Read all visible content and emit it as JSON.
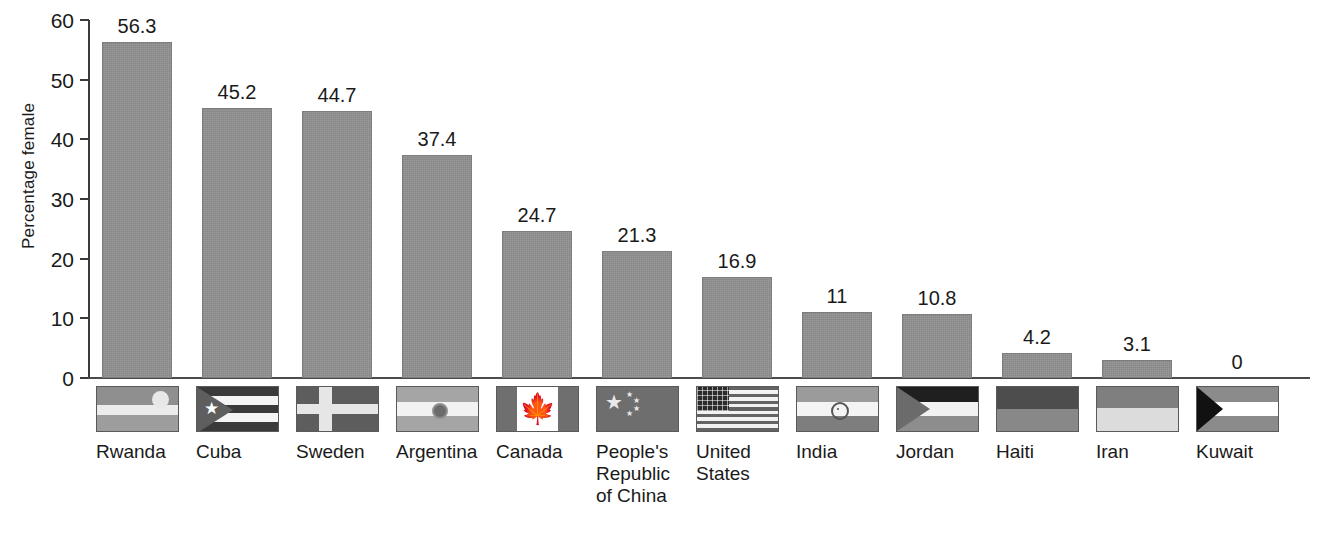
{
  "chart_data": {
    "type": "bar",
    "title": "",
    "subtitle": "",
    "xlabel": "",
    "ylabel": "Percentage female",
    "ylim": [
      0,
      60
    ],
    "yticks": [
      0,
      10,
      20,
      30,
      40,
      50,
      60
    ],
    "ytick_labels": [
      "0",
      "10",
      "20",
      "30",
      "40",
      "50",
      "60"
    ],
    "grid": false,
    "legend": null,
    "categories": [
      "Rwanda",
      "Cuba",
      "Sweden",
      "Argentina",
      "Canada",
      "People's\nRepublic\nof China",
      "United\nStates",
      "India",
      "Jordan",
      "Haiti",
      "Iran",
      "Kuwait"
    ],
    "values": [
      56.3,
      45.2,
      44.7,
      37.4,
      24.7,
      21.3,
      16.9,
      11,
      10.8,
      4.2,
      3.1,
      0
    ],
    "value_labels": [
      "56.3",
      "45.2",
      "44.7",
      "37.4",
      "24.7",
      "21.3",
      "16.9",
      "11",
      "10.8",
      "4.2",
      "3.1",
      "0"
    ],
    "bar_color": "#8e8e8e",
    "axis_color": "#3b3b3b"
  },
  "axis": {
    "y_title": "Percentage female",
    "ticks": [
      {
        "label": "60",
        "value": 60
      },
      {
        "label": "50",
        "value": 50
      },
      {
        "label": "40",
        "value": 40
      },
      {
        "label": "30",
        "value": 30
      },
      {
        "label": "20",
        "value": 20
      },
      {
        "label": "10",
        "value": 10
      },
      {
        "label": "0",
        "value": 0
      }
    ]
  },
  "bars": [
    {
      "country": "Rwanda",
      "value": 56.3,
      "label": "56.3",
      "flag": "rwanda-flag-icon",
      "name_lines": "Rwanda"
    },
    {
      "country": "Cuba",
      "value": 45.2,
      "label": "45.2",
      "flag": "cuba-flag-icon",
      "name_lines": "Cuba"
    },
    {
      "country": "Sweden",
      "value": 44.7,
      "label": "44.7",
      "flag": "sweden-flag-icon",
      "name_lines": "Sweden"
    },
    {
      "country": "Argentina",
      "value": 37.4,
      "label": "37.4",
      "flag": "argentina-flag-icon",
      "name_lines": "Argentina"
    },
    {
      "country": "Canada",
      "value": 24.7,
      "label": "24.7",
      "flag": "canada-flag-icon",
      "name_lines": "Canada"
    },
    {
      "country": "People's Republic of China",
      "value": 21.3,
      "label": "21.3",
      "flag": "china-flag-icon",
      "name_lines": "People's\nRepublic\nof China"
    },
    {
      "country": "United States",
      "value": 16.9,
      "label": "16.9",
      "flag": "united-states-flag-icon",
      "name_lines": "United\nStates"
    },
    {
      "country": "India",
      "value": 11,
      "label": "11",
      "flag": "india-flag-icon",
      "name_lines": "India"
    },
    {
      "country": "Jordan",
      "value": 10.8,
      "label": "10.8",
      "flag": "jordan-flag-icon",
      "name_lines": "Jordan"
    },
    {
      "country": "Haiti",
      "value": 4.2,
      "label": "4.2",
      "flag": "haiti-flag-icon",
      "name_lines": "Haiti"
    },
    {
      "country": "Iran",
      "value": 3.1,
      "label": "3.1",
      "flag": "iran-flag-icon",
      "name_lines": "Iran"
    },
    {
      "country": "Kuwait",
      "value": 0,
      "label": "0",
      "flag": "kuwait-flag-icon",
      "name_lines": "Kuwait"
    }
  ]
}
